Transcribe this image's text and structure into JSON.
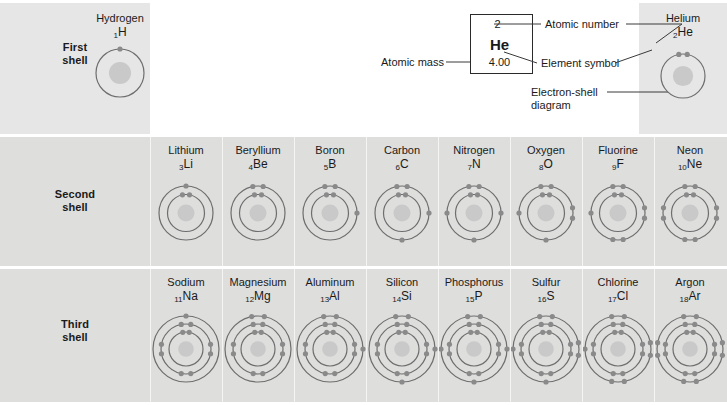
{
  "figure": {
    "colors": {
      "row_background": "#dededd",
      "first_row_background": "#e6e6e6",
      "shell_ring": "#6e6e6e",
      "electron": "#8a8a8a",
      "nucleus": "#c9c9c9",
      "divider": "#f4f4f3",
      "text": "#1a1a1a"
    }
  },
  "legend": {
    "atomic_number": "2",
    "element_symbol": "He",
    "atomic_mass": "4.00",
    "label_atomic_number": "Atomic number",
    "label_element_symbol": "Element symbol",
    "label_atomic_mass": "Atomic mass",
    "label_electron_shell_diagram": "Electron-shell diagram"
  },
  "rows": [
    {
      "id": "first",
      "label_line1": "First",
      "label_line2": "shell"
    },
    {
      "id": "second",
      "label_line1": "Second",
      "label_line2": "shell"
    },
    {
      "id": "third",
      "label_line1": "Third",
      "label_line2": "shell"
    }
  ],
  "elements": {
    "first_shell": [
      {
        "name": "Hydrogen",
        "number": "1",
        "symbol": "H",
        "shells": [
          1
        ]
      },
      {
        "name": "Helium",
        "number": "2",
        "symbol": "He",
        "shells": [
          2
        ]
      }
    ],
    "second_shell": [
      {
        "name": "Lithium",
        "number": "3",
        "symbol": "Li",
        "shells": [
          2,
          1
        ]
      },
      {
        "name": "Beryllium",
        "number": "4",
        "symbol": "Be",
        "shells": [
          2,
          2
        ]
      },
      {
        "name": "Boron",
        "number": "5",
        "symbol": "B",
        "shells": [
          2,
          3
        ]
      },
      {
        "name": "Carbon",
        "number": "6",
        "symbol": "C",
        "shells": [
          2,
          4
        ]
      },
      {
        "name": "Nitrogen",
        "number": "7",
        "symbol": "N",
        "shells": [
          2,
          5
        ]
      },
      {
        "name": "Oxygen",
        "number": "8",
        "symbol": "O",
        "shells": [
          2,
          6
        ]
      },
      {
        "name": "Fluorine",
        "number": "9",
        "symbol": "F",
        "shells": [
          2,
          7
        ]
      },
      {
        "name": "Neon",
        "number": "10",
        "symbol": "Ne",
        "shells": [
          2,
          8
        ]
      }
    ],
    "third_shell": [
      {
        "name": "Sodium",
        "number": "11",
        "symbol": "Na",
        "shells": [
          2,
          8,
          1
        ]
      },
      {
        "name": "Magnesium",
        "number": "12",
        "symbol": "Mg",
        "shells": [
          2,
          8,
          2
        ]
      },
      {
        "name": "Aluminum",
        "number": "13",
        "symbol": "Al",
        "shells": [
          2,
          8,
          3
        ]
      },
      {
        "name": "Silicon",
        "number": "14",
        "symbol": "Si",
        "shells": [
          2,
          8,
          4
        ]
      },
      {
        "name": "Phosphorus",
        "number": "15",
        "symbol": "P",
        "shells": [
          2,
          8,
          5
        ]
      },
      {
        "name": "Sulfur",
        "number": "16",
        "symbol": "S",
        "shells": [
          2,
          8,
          6
        ]
      },
      {
        "name": "Chlorine",
        "number": "17",
        "symbol": "Cl",
        "shells": [
          2,
          8,
          7
        ]
      },
      {
        "name": "Argon",
        "number": "18",
        "symbol": "Ar",
        "shells": [
          2,
          8,
          8
        ]
      }
    ]
  }
}
